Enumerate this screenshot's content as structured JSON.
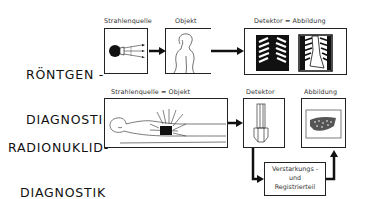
{
  "rows": {
    "roentgen": {
      "title_line1": "RÖNTGEN -",
      "title_line2": "DIAGNOSTIK",
      "labels": {
        "source": "Strahlenquelle",
        "object": "Objekt",
        "detector_image": "Detektor  =  Abbildung"
      }
    },
    "radionuklid": {
      "title_line1": "RADIONUKLID-",
      "title_line2": "DIAGNOSTIK",
      "labels": {
        "source_object": "Strahlenquelle  =  Objekt",
        "detector": "Detektor",
        "image": "Abbildung",
        "amplifier_line1": "Verstarkungs -",
        "amplifier_line2": "und",
        "amplifier_line3": "Registrierteil"
      }
    }
  }
}
